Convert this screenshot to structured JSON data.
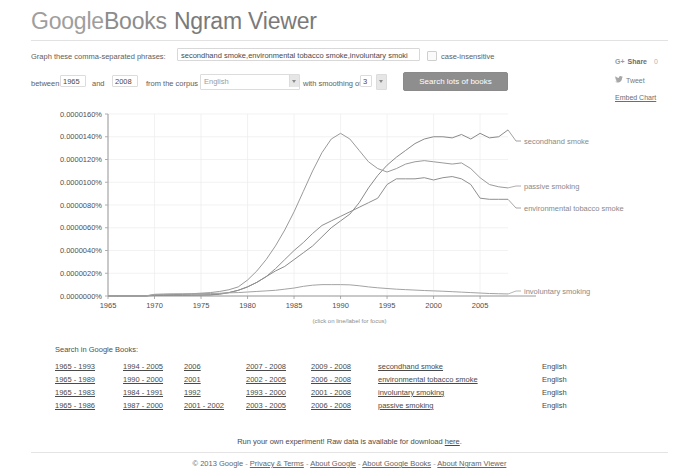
{
  "header": {
    "logo_google": "Google",
    "logo_books": "Books",
    "logo_ngram": "Ngram Viewer"
  },
  "form": {
    "phrases_label": "Graph these comma-separated phrases:",
    "phrases_value": "secondhand smoke,environmental tobacco smoke,involuntary smoki",
    "phrases_placeholder": "Enter comma-separated phrases",
    "case_insensitive_label": "case-insensitive",
    "between_label": "between",
    "year_start": "1965",
    "and_label": "and",
    "year_end": "2008",
    "corpus_label": "from the corpus",
    "corpus_value": "English",
    "smoothing_label": "with smoothing of",
    "smoothing_value": "3",
    "search_button": "Search lots of books"
  },
  "share": {
    "gplus_icon": "G+",
    "gplus_label": "Share",
    "gplus_count": "0",
    "tweet_label": "Tweet",
    "embed_label": "Embed Chart"
  },
  "chart_data": {
    "type": "line",
    "title": "",
    "xlabel": "",
    "ylabel": "",
    "grid": true,
    "legend_position": "right-inline",
    "annotation": "(click on line/label for focus)",
    "xlim": [
      1965,
      2008
    ],
    "ylim": [
      0.0,
      1.6e-05
    ],
    "xticks": [
      "1965",
      "1970",
      "1975",
      "1980",
      "1985",
      "1990",
      "1995",
      "2000",
      "2005"
    ],
    "yticks": [
      "0.0000000%",
      "0.0000020%",
      "0.0000040%",
      "0.0000060%",
      "0.0000080%",
      "0.0000100%",
      "0.0000120%",
      "0.0000140%",
      "0.0000160%"
    ],
    "x": [
      1965,
      1966,
      1967,
      1968,
      1969,
      1970,
      1971,
      1972,
      1973,
      1974,
      1975,
      1976,
      1977,
      1978,
      1979,
      1980,
      1981,
      1982,
      1983,
      1984,
      1985,
      1986,
      1987,
      1988,
      1989,
      1990,
      1991,
      1992,
      1993,
      1994,
      1995,
      1996,
      1997,
      1998,
      1999,
      2000,
      2001,
      2002,
      2003,
      2004,
      2005,
      2006,
      2007,
      2008
    ],
    "series": [
      {
        "name": "secondhand smoke",
        "color": "#8a8a8a",
        "values": [
          0.0,
          0.0,
          0.0,
          0.0,
          0.0,
          5e-08,
          5e-08,
          6e-08,
          6e-08,
          7e-08,
          8e-08,
          1e-07,
          1.5e-07,
          3e-07,
          5e-07,
          8e-07,
          1.2e-06,
          1.7e-06,
          2.2e-06,
          2.6e-06,
          3.2e-06,
          3.8e-06,
          4.4e-06,
          5.2e-06,
          6e-06,
          6.6e-06,
          7.2e-06,
          8.2e-06,
          9.5e-06,
          1.06e-05,
          1.15e-05,
          1.22e-05,
          1.28e-05,
          1.34e-05,
          1.38e-05,
          1.4e-05,
          1.4e-05,
          1.39e-05,
          1.42e-05,
          1.38e-05,
          1.43e-05,
          1.39e-05,
          1.4e-05,
          1.46e-05
        ]
      },
      {
        "name": "passive smoking",
        "color": "#9a9a9a",
        "values": [
          0.0,
          0.0,
          0.0,
          0.0,
          0.0,
          1e-07,
          1e-07,
          1.2e-07,
          1.5e-07,
          2e-07,
          2.5e-07,
          3e-07,
          4e-07,
          5.5e-07,
          8e-07,
          1.4e-06,
          2.2e-06,
          3.2e-06,
          4.4e-06,
          5.8e-06,
          7.4e-06,
          9.2e-06,
          1.1e-05,
          1.26e-05,
          1.38e-05,
          1.43e-05,
          1.38e-05,
          1.28e-05,
          1.18e-05,
          1.12e-05,
          1.09e-05,
          1.12e-05,
          1.16e-05,
          1.18e-05,
          1.19e-05,
          1.18e-05,
          1.17e-05,
          1.16e-05,
          1.17e-05,
          1.12e-05,
          1.04e-05,
          9.8e-06,
          9.6e-06,
          9.5e-06
        ]
      },
      {
        "name": "environmental tobacco smoke",
        "color": "#8f8f8f",
        "values": [
          0.0,
          0.0,
          0.0,
          0.0,
          0.0,
          1e-07,
          1e-07,
          1e-07,
          1e-07,
          1e-07,
          1e-07,
          1e-07,
          2e-07,
          3e-07,
          5e-07,
          8e-07,
          1.2e-06,
          1.7e-06,
          2.4e-06,
          3.2e-06,
          4e-06,
          4.7e-06,
          5.5e-06,
          6.2e-06,
          6.6e-06,
          7e-06,
          7.4e-06,
          7.8e-06,
          8.2e-06,
          8.6e-06,
          9.8e-06,
          1.03e-05,
          1.03e-05,
          1.03e-05,
          1.04e-05,
          1.02e-05,
          1.04e-05,
          1.05e-05,
          1.03e-05,
          9.8e-06,
          8.6e-06,
          8.5e-06,
          8.5e-06,
          8.5e-06
        ]
      },
      {
        "name": "involuntary smoking",
        "color": "#a3a3a3",
        "values": [
          0.0,
          0.0,
          0.0,
          0.0,
          0.0,
          1.5e-07,
          1.8e-07,
          2e-07,
          2e-07,
          2e-07,
          2.2e-07,
          2.2e-07,
          2.4e-07,
          2.8e-07,
          3e-07,
          3.5e-07,
          4e-07,
          4.5e-07,
          5e-07,
          6e-07,
          7e-07,
          8.5e-07,
          9.5e-07,
          1e-06,
          1e-06,
          1e-06,
          9.8e-07,
          9e-07,
          8e-07,
          7.2e-07,
          6.6e-07,
          6e-07,
          5.6e-07,
          5.2e-07,
          4.8e-07,
          4.5e-07,
          4.2e-07,
          3.8e-07,
          3.4e-07,
          3e-07,
          2.6e-07,
          2.2e-07,
          2e-07,
          1.8e-07
        ]
      }
    ]
  },
  "search_in_books": {
    "title": "Search in Google Books:",
    "rows": [
      [
        "1965 - 1993",
        "1994 - 2005",
        "2006",
        "2007 - 2008",
        "2009 - 2008",
        "secondhand smoke",
        "English"
      ],
      [
        "1965 - 1989",
        "1990 - 2000",
        "2001",
        "2002 - 2005",
        "2006 - 2008",
        "environmental tobacco smoke",
        "English"
      ],
      [
        "1965 - 1983",
        "1984 - 1991",
        "1992",
        "1993 - 2000",
        "2001 - 2008",
        "involuntary smoking",
        "English"
      ],
      [
        "1965 - 1986",
        "1987 - 2000",
        "2001 - 2002",
        "2003 - 2005",
        "2006 - 2008",
        "passive smoking",
        "English"
      ]
    ]
  },
  "footer": {
    "raw_prefix": "Run your own experiment! Raw data is available for download ",
    "raw_link": "here",
    "raw_suffix": ".",
    "copyright": "© 2013 Google",
    "links": [
      "Privacy & Terms",
      "About Google",
      "About Google Books",
      "About Ngram Viewer"
    ]
  }
}
